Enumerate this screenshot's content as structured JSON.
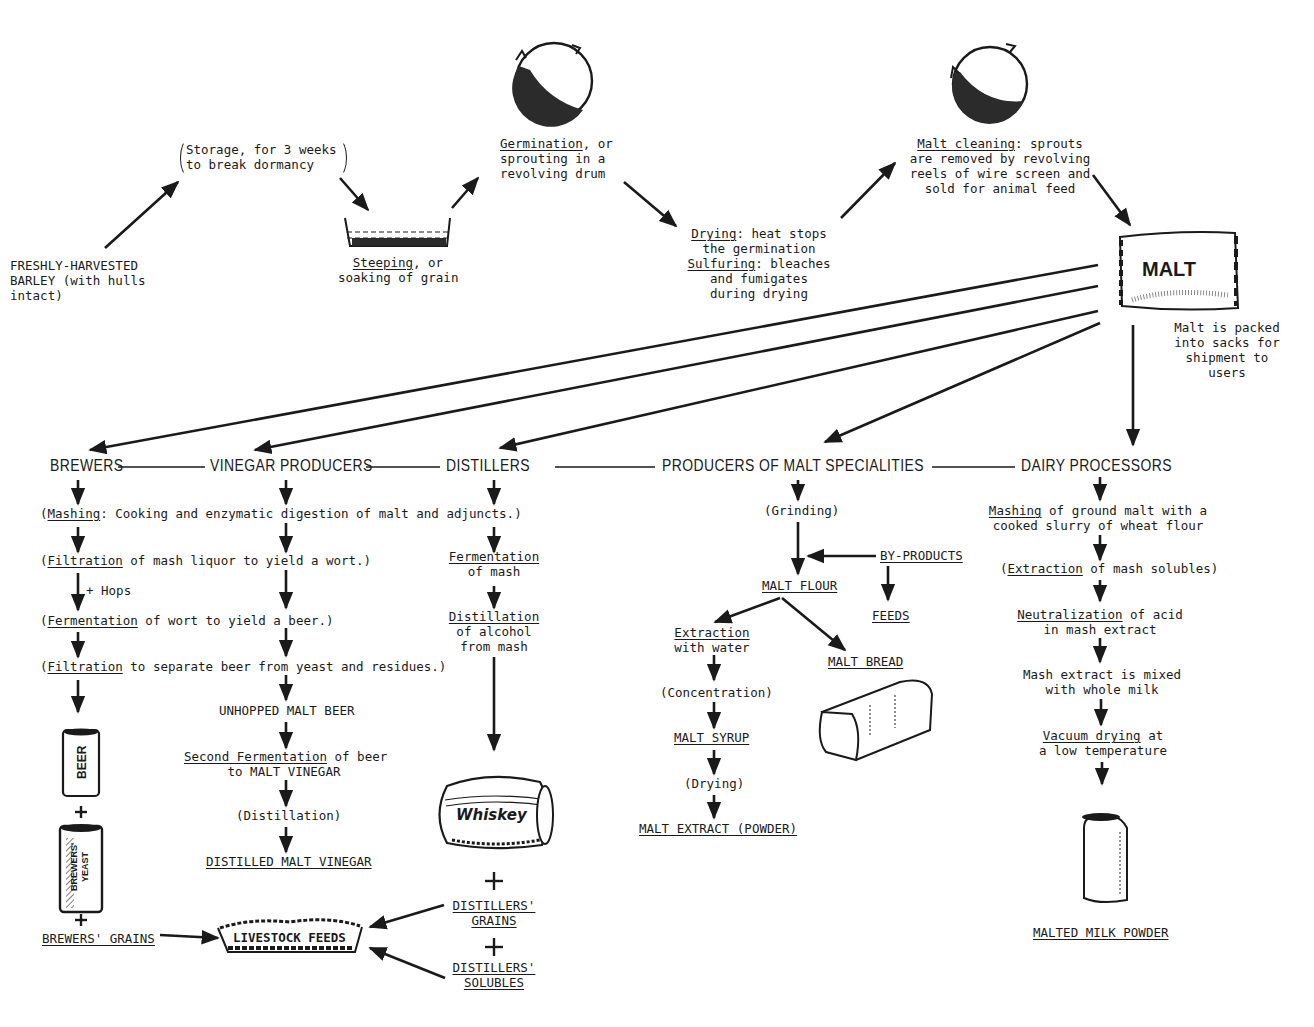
{
  "diagram": {
    "type": "process-flow"
  },
  "malting_steps": {
    "barley": "FRESHLY-HARVESTED\nBARLEY (with hulls\nintact)",
    "storage": "Storage, for 3 weeks\nto break dormancy",
    "steeping_term": "Steeping",
    "steeping_rest": ", or",
    "steeping_line2": "soaking of grain",
    "germination_term": "Germination",
    "germination_rest": ", or",
    "germination_lines": "sprouting in a\nrevolving drum",
    "drying_term": "Drying",
    "drying_rest": ": heat stops",
    "drying_line2": "the germination",
    "sulfuring_term": "Sulfuring",
    "sulfuring_rest": ": bleaches",
    "sulfuring_lines": "and fumigates\nduring drying",
    "cleaning_term": "Malt cleaning",
    "cleaning_rest": ": sprouts",
    "cleaning_lines": "are removed by revolving\nreels of wire screen and\nsold for animal feed",
    "malt_sack_label": "MALT",
    "malt_note": "Malt is packed\ninto sacks for\nshipment to\nusers"
  },
  "users": {
    "brewers": "BREWERS",
    "vinegar": "VINEGAR PRODUCERS",
    "distillers": "DISTILLERS",
    "specialities": "PRODUCERS OF MALT SPECIALITIES",
    "dairy": "DAIRY PROCESSORS"
  },
  "shared_steps": {
    "mashing_term": "Mashing",
    "mashing_rest": ": Cooking and enzymatic digestion of malt and adjuncts.)",
    "filtration1_term": "Filtration",
    "filtration1_rest": " of mash liquor to yield a wort.)",
    "hops": "+ Hops",
    "fermentation_term": "Fermentation",
    "fermentation_rest": " of wort to yield a beer.)",
    "filtration2_term": "Filtration",
    "filtration2_rest": " to separate beer from yeast and residues.)",
    "open_paren": "("
  },
  "brewers": {
    "beer_can": "BEER",
    "yeast_can": "BREWERS'\nYEAST",
    "plus": "+",
    "grains": "BREWERS' GRAINS"
  },
  "vinegar": {
    "unhopped": "UNHOPPED MALT BEER",
    "second_term": "Second Fermentation",
    "second_rest": " of beer",
    "second_line2": "to MALT VINEGAR",
    "distillation": "(Distillation)",
    "product": "DISTILLED MALT VINEGAR"
  },
  "distillers": {
    "fermentation_term": "Fermentation",
    "fermentation_line2": "of mash",
    "distillation_term": "Distillation",
    "distillation_lines": "of alcohol\nfrom mash",
    "barrel_label": "Whiskey",
    "plus": "+",
    "grains": "DISTILLERS'\nGRAINS",
    "solubles": "DISTILLERS'\nSOLUBLES"
  },
  "livestock": {
    "label": "LIVESTOCK FEEDS"
  },
  "specialities": {
    "grinding": "(Grinding)",
    "byproducts": "BY-PRODUCTS",
    "feeds": "FEEDS",
    "malt_flour": "MALT FLOUR",
    "extraction_term": "Extraction",
    "extraction_line2": "with water",
    "malt_bread": "MALT BREAD",
    "concentration": "(Concentration)",
    "malt_syrup": "MALT SYRUP",
    "drying": "(Drying)",
    "extract_powder": "MALT EXTRACT (POWDER)"
  },
  "dairy": {
    "mashing_term": "Mashing",
    "mashing_rest": " of ground malt with a",
    "mashing_line2": "cooked slurry of wheat flour",
    "extraction_term": "Extraction",
    "extraction_rest": " of mash solubles)",
    "neutral_term": "Neutralization",
    "neutral_rest": " of acid",
    "neutral_line2": "in mash extract",
    "mixed": "Mash extract is mixed\nwith whole milk",
    "vacuum_term": "Vacuum drying",
    "vacuum_rest": " at",
    "vacuum_line2": "a low temperature",
    "product": "MALTED MILK POWDER"
  },
  "colors": {
    "ink": "#1a1a1a",
    "background": "#ffffff"
  }
}
